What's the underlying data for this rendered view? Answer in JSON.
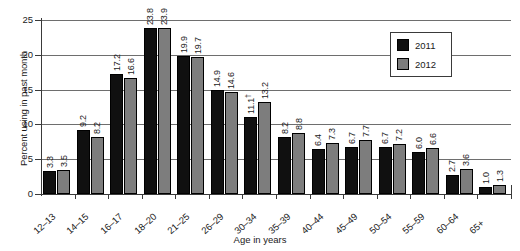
{
  "chart_data": {
    "type": "bar",
    "title": "",
    "xlabel": "Age in years",
    "ylabel": "Percent using in past month",
    "ylim": [
      0,
      25
    ],
    "yticks": [
      0,
      5,
      10,
      15,
      20,
      25
    ],
    "grid": true,
    "legend_position": "top-right",
    "categories": [
      "12–13",
      "14–15",
      "16–17",
      "18–20",
      "21–25",
      "26–29",
      "30–34",
      "35–39",
      "40–44",
      "45–49",
      "50–54",
      "55–59",
      "60–64",
      "65+"
    ],
    "series": [
      {
        "name": "2011",
        "color": "#101010",
        "values": [
          3.3,
          9.2,
          17.2,
          23.8,
          19.9,
          14.9,
          11.1,
          8.2,
          6.4,
          6.7,
          6.7,
          6.0,
          2.7,
          1.0
        ],
        "labels": [
          "3.3",
          "9.2",
          "17.2",
          "23.8",
          "19.9",
          "14.9",
          "11.1†",
          "8.2",
          "6.4",
          "6.7",
          "6.7",
          "6.0",
          "2.7",
          "1.0"
        ]
      },
      {
        "name": "2012",
        "color": "#7d7d7d",
        "values": [
          3.5,
          8.2,
          16.6,
          23.9,
          19.7,
          14.6,
          13.2,
          8.8,
          7.3,
          7.7,
          7.2,
          6.6,
          3.6,
          1.3
        ],
        "labels": [
          "3.5",
          "8.2",
          "16.6",
          "23.9",
          "19.7",
          "14.6",
          "13.2",
          "8.8",
          "7.3",
          "7.7",
          "7.2",
          "6.6",
          "3.6",
          "1.3"
        ]
      }
    ]
  },
  "legend": {
    "items": [
      {
        "label": "2011"
      },
      {
        "label": "2012"
      }
    ]
  }
}
